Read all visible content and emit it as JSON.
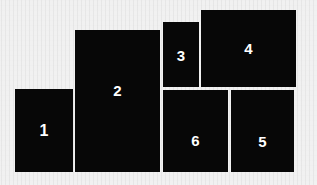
{
  "figure": {
    "kind": "rectangle-packing-diagram",
    "background_color": "#f1f1f1",
    "rect_color": "#070707",
    "label_color": "#ffffff",
    "canvas": {
      "width": 317,
      "height": 185
    }
  },
  "rectangles": [
    {
      "id": "rect-1",
      "label": "1",
      "x": 15,
      "y": 89,
      "width": 58,
      "height": 83
    },
    {
      "id": "rect-2",
      "label": "2",
      "x": 75,
      "y": 30,
      "width": 85,
      "height": 142
    },
    {
      "id": "rect-3",
      "label": "3",
      "x": 163,
      "y": 22,
      "width": 36,
      "height": 65
    },
    {
      "id": "rect-4",
      "label": "4",
      "x": 201,
      "y": 10,
      "width": 95,
      "height": 77
    },
    {
      "id": "rect-5",
      "label": "5",
      "x": 231,
      "y": 90,
      "width": 63,
      "height": 82
    },
    {
      "id": "rect-6",
      "label": "6",
      "x": 163,
      "y": 90,
      "width": 65,
      "height": 82
    }
  ]
}
